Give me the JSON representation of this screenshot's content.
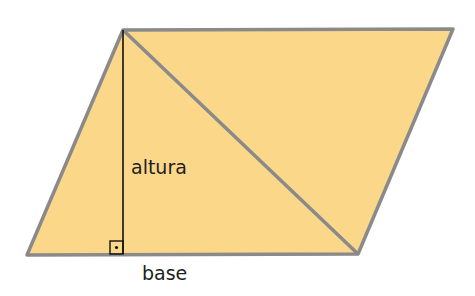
{
  "diagram": {
    "shape": "parallelogram",
    "fill_color": "#fbd78a",
    "edge_color": "#8a8a8a",
    "height_line_color": "#111111",
    "labels": {
      "height": "altura",
      "base": "base"
    },
    "right_angle_marker": "square-with-dot"
  }
}
